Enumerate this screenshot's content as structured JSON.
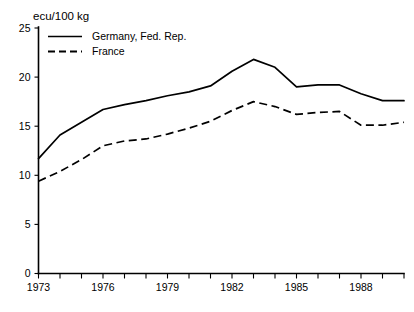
{
  "chart_data": {
    "type": "line",
    "title": "ecu/100 kg",
    "xlabel": "",
    "ylabel": "",
    "unit_label": "ecu/100 kg",
    "grid": false,
    "legend_position": "top-left",
    "xlim": [
      1973,
      1990
    ],
    "ylim": [
      0,
      25
    ],
    "yticks": [
      0,
      5,
      10,
      15,
      20,
      25
    ],
    "ytick_labels": [
      "0",
      "5",
      "10",
      "15",
      "20",
      "25"
    ],
    "xticks": [
      1973,
      1974,
      1975,
      1976,
      1977,
      1978,
      1979,
      1980,
      1981,
      1982,
      1983,
      1984,
      1985,
      1986,
      1987,
      1988,
      1989,
      1990
    ],
    "xtick_labels_shown": [
      "1973",
      "1976",
      "1979",
      "1982",
      "1985",
      "1988"
    ],
    "xtick_labels_shown_at": [
      1973,
      1976,
      1979,
      1982,
      1985,
      1988
    ],
    "x": [
      1973,
      1974,
      1975,
      1976,
      1977,
      1978,
      1979,
      1980,
      1981,
      1982,
      1983,
      1984,
      1985,
      1986,
      1987,
      1988,
      1989,
      1990
    ],
    "series": [
      {
        "name": "Germany, Fed. Rep.",
        "style": "solid",
        "color": "#000000",
        "values": [
          11.7,
          14.1,
          15.4,
          16.7,
          17.2,
          17.6,
          18.1,
          18.5,
          19.1,
          20.6,
          21.8,
          21.0,
          19.0,
          19.2,
          19.2,
          18.3,
          17.6,
          17.6
        ]
      },
      {
        "name": "France",
        "style": "dashed",
        "color": "#000000",
        "values": [
          9.4,
          10.4,
          11.6,
          13.0,
          13.5,
          13.7,
          14.2,
          14.8,
          15.5,
          16.6,
          17.5,
          17.0,
          16.2,
          16.4,
          16.5,
          15.1,
          15.1,
          15.4
        ]
      }
    ]
  },
  "legend": {
    "entries": [
      {
        "label": "Germany, Fed. Rep.",
        "style": "solid"
      },
      {
        "label": "France",
        "style": "dashed"
      }
    ]
  }
}
